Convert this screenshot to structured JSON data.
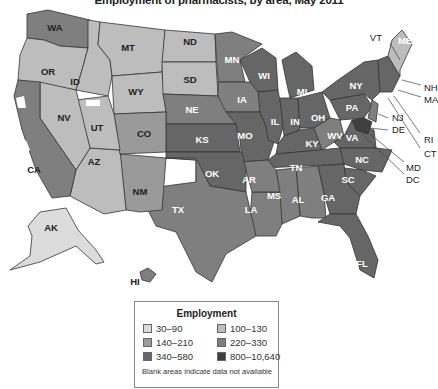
{
  "title": "Employment of pharmacists, by area, May 2011",
  "legend": {
    "title": "Employment",
    "classes": [
      {
        "range": "30–90",
        "color": "#dcdcdc"
      },
      {
        "range": "100–130",
        "color": "#bdbdbd"
      },
      {
        "range": "140–210",
        "color": "#9a9a9a"
      },
      {
        "range": "220–330",
        "color": "#7f7f7f"
      },
      {
        "range": "340–580",
        "color": "#666666"
      },
      {
        "range": "800–10,640",
        "color": "#3f3f3f"
      }
    ],
    "note": "Blank areas indicate data not available"
  },
  "states": {
    "WA": {
      "label": "WA",
      "class": 3
    },
    "OR": {
      "label": "OR",
      "class": 1
    },
    "ID": {
      "label": "ID",
      "class": 1
    },
    "MT": {
      "label": "MT",
      "class": 1
    },
    "WY": {
      "label": "WY",
      "class": 1
    },
    "ND": {
      "label": "ND",
      "class": 1
    },
    "SD": {
      "label": "SD",
      "class": 1
    },
    "NE": {
      "label": "NE",
      "class": 3
    },
    "KS": {
      "label": "KS",
      "class": 4
    },
    "MN": {
      "label": "MN",
      "class": 3
    },
    "IA": {
      "label": "IA",
      "class": 3
    },
    "MO": {
      "label": "MO",
      "class": 4
    },
    "WI": {
      "label": "WI",
      "class": 4
    },
    "IL": {
      "label": "IL",
      "class": 4
    },
    "MI": {
      "label": "MI",
      "class": 4
    },
    "IN": {
      "label": "IN",
      "class": 4
    },
    "OH": {
      "label": "OH",
      "class": 4
    },
    "KY": {
      "label": "KY",
      "class": 4
    },
    "TN": {
      "label": "TN",
      "class": 4
    },
    "WV": {
      "label": "WV",
      "class": 3
    },
    "VA": {
      "label": "VA",
      "class": 4
    },
    "NC": {
      "label": "NC",
      "class": 4
    },
    "SC": {
      "label": "SC",
      "class": 4
    },
    "GA": {
      "label": "GA",
      "class": 4
    },
    "FL": {
      "label": "FL",
      "class": 4
    },
    "AL": {
      "label": "AL",
      "class": 3
    },
    "MS": {
      "label": "MS",
      "class": 3
    },
    "LA": {
      "label": "LA",
      "class": 3
    },
    "AR": {
      "label": "AR",
      "class": 3
    },
    "OK": {
      "label": "OK",
      "class": 4
    },
    "TX": {
      "label": "TX",
      "class": 3
    },
    "NM": {
      "label": "NM",
      "class": 2
    },
    "AZ": {
      "label": "AZ",
      "class": 1
    },
    "CO": {
      "label": "CO",
      "class": 2
    },
    "UT": {
      "label": "UT",
      "class": 1
    },
    "NV": {
      "label": "NV",
      "class": 1
    },
    "CA": {
      "label": "CA",
      "class": 3
    },
    "PA": {
      "label": "PA",
      "class": 4
    },
    "NY": {
      "label": "NY",
      "class": 4
    },
    "ME": {
      "label": "ME",
      "class": 1
    },
    "AK": {
      "label": "AK",
      "class": 0
    },
    "HI": {
      "label": "HI",
      "class": 3
    }
  },
  "callouts": [
    "VT",
    "NH",
    "MA",
    "RI",
    "CT",
    "NJ",
    "DE",
    "MD",
    "DC"
  ]
}
